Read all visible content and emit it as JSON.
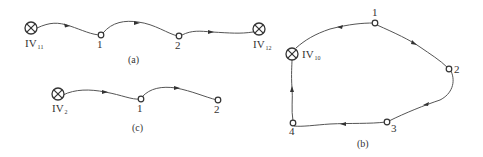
{
  "diagrams": {
    "a": {
      "caption": "(a)",
      "start": {
        "label": "IV",
        "sub": "11"
      },
      "nodes": [
        "1",
        "2"
      ],
      "end": {
        "label": "IV",
        "sub": "12"
      }
    },
    "b": {
      "caption": "(b)",
      "source": {
        "label": "IV",
        "sub": "10"
      },
      "nodes": [
        "1",
        "2",
        "3",
        "4"
      ]
    },
    "c": {
      "caption": "(c)",
      "start": {
        "label": "IV",
        "sub": "2"
      },
      "nodes": [
        "1",
        "2"
      ]
    }
  }
}
